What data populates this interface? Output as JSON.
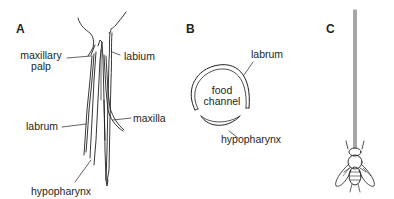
{
  "figure": {
    "panels": [
      {
        "letter": "A",
        "subject": "mouthpart stylets",
        "labels": {
          "maxillary_palp_line1": "maxillary",
          "maxillary_palp_line2": "palp",
          "labium": "labium",
          "labrum": "labrum",
          "maxilla": "maxilla",
          "hypopharynx": "hypopharynx"
        }
      },
      {
        "letter": "B",
        "subject": "cross-section of feeding tube",
        "labels": {
          "labrum": "labrum",
          "food_channel_line1": "food",
          "food_channel_line2": "channel",
          "hypopharynx": "hypopharynx"
        }
      },
      {
        "letter": "C",
        "subject": "fly with long proboscis"
      }
    ],
    "colors": {
      "ink": "#231f20",
      "background": "#ffffff"
    }
  }
}
